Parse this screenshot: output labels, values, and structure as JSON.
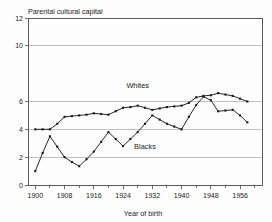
{
  "chart_data": {
    "type": "line",
    "title": "Parental cultural capital",
    "xlabel": "Year of birth",
    "ylabel": "",
    "xlim": [
      1898,
      1962
    ],
    "ylim": [
      0,
      12
    ],
    "grid": true,
    "legend_position": "inline-annotation",
    "x_ticks": [
      1900,
      1908,
      1916,
      1924,
      1932,
      1940,
      1948,
      1956
    ],
    "x_tick_labels": [
      "1900",
      "1908",
      "1916",
      "1924",
      "1932",
      "1940",
      "1948",
      "1956"
    ],
    "x_minor_ticks": [
      1904,
      1912,
      1920,
      1928,
      1936,
      1944,
      1952,
      1960
    ],
    "y_ticks": [
      0,
      2,
      4,
      6,
      10,
      12
    ],
    "y_tick_labels": [
      "0",
      "2",
      "4",
      "6",
      "10",
      "12"
    ],
    "y_gridlines": [
      2,
      4,
      6,
      10
    ],
    "annotations": [
      {
        "text": "Whites",
        "x": 1928,
        "y": 7.0
      },
      {
        "text": "Blacks",
        "x": 1930,
        "y": 2.6
      }
    ],
    "series": [
      {
        "name": "Whites",
        "color": "#1a1a1a",
        "x": [
          1900,
          1902,
          1904,
          1906,
          1908,
          1910,
          1912,
          1914,
          1916,
          1918,
          1920,
          1922,
          1924,
          1926,
          1928,
          1930,
          1932,
          1934,
          1936,
          1938,
          1940,
          1942,
          1944,
          1946,
          1948,
          1950,
          1952,
          1954,
          1956,
          1958
        ],
        "values": [
          4.0,
          4.0,
          4.0,
          4.4,
          4.9,
          4.95,
          5.0,
          5.05,
          5.15,
          5.1,
          5.05,
          5.3,
          5.55,
          5.6,
          5.7,
          5.55,
          5.4,
          5.5,
          5.6,
          5.65,
          5.7,
          5.9,
          6.3,
          6.4,
          6.45,
          6.6,
          6.5,
          6.4,
          6.2,
          6.0
        ]
      },
      {
        "name": "Blacks",
        "color": "#1a1a1a",
        "x": [
          1900,
          1902,
          1904,
          1906,
          1908,
          1910,
          1912,
          1914,
          1916,
          1918,
          1920,
          1922,
          1924,
          1926,
          1928,
          1930,
          1932,
          1934,
          1936,
          1938,
          1940,
          1942,
          1944,
          1946,
          1948,
          1950,
          1952,
          1954,
          1956,
          1958
        ],
        "values": [
          1.0,
          2.3,
          3.5,
          2.75,
          2.0,
          1.65,
          1.35,
          1.85,
          2.4,
          3.1,
          3.8,
          3.3,
          2.8,
          3.3,
          3.8,
          4.4,
          5.0,
          4.7,
          4.4,
          4.2,
          4.0,
          4.9,
          5.75,
          6.35,
          6.1,
          5.3,
          5.35,
          5.4,
          5.0,
          4.5
        ]
      }
    ]
  }
}
